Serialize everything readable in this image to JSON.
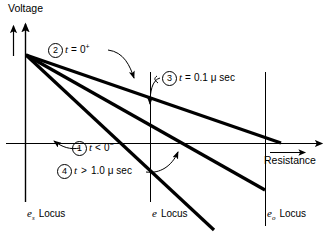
{
  "figure": {
    "type": "diagram",
    "axes": {
      "y_label": "Voltage",
      "x_label": "Resistance"
    },
    "callouts": [
      {
        "number": "1",
        "marker": "①",
        "text_italic": "t",
        "relation": "<",
        "value": "0",
        "exponent": "−",
        "full": "t < 0⁻"
      },
      {
        "number": "2",
        "marker": "②",
        "text_italic": "t",
        "relation": "=",
        "value": "0",
        "exponent": "+",
        "full": "t = 0⁺"
      },
      {
        "number": "3",
        "marker": "③",
        "text_italic": "t",
        "relation": "=",
        "value": "0.1",
        "unit": "μ sec",
        "full": "t = 0.1 μ sec"
      },
      {
        "number": "4",
        "marker": "④",
        "text_italic": "t",
        "relation": ">",
        "value": "1.0",
        "unit": "μ sec",
        "full": "t > 1.0 μ sec"
      }
    ],
    "loci": [
      {
        "symbol": "e",
        "subscript": "s",
        "label": "Locus",
        "full": "eₛ Locus"
      },
      {
        "symbol": "e",
        "subscript": "",
        "label": "Locus",
        "full": "e Locus"
      },
      {
        "symbol": "e",
        "subscript": "o",
        "label": "Locus",
        "full": "eₒ Locus"
      }
    ],
    "colors": {
      "line": "#000000",
      "axis": "#000000",
      "background": "#ffffff"
    }
  }
}
